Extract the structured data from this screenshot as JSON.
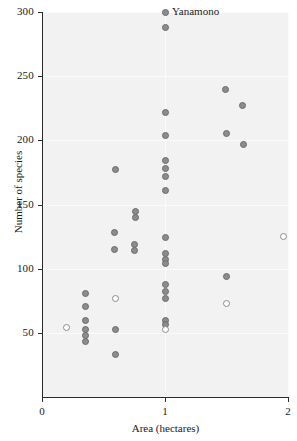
{
  "chart_data": {
    "type": "scatter",
    "title": "",
    "xlabel": "Area (hectares)",
    "ylabel": "Number of species",
    "xlim": [
      0,
      2
    ],
    "ylim": [
      0,
      300
    ],
    "xticks": [
      0,
      1,
      2
    ],
    "xtick_labels": [
      "0",
      "1",
      "2"
    ],
    "yticks": [
      50,
      100,
      150,
      200,
      250,
      300
    ],
    "ytick_labels": [
      "50",
      "100",
      "150",
      "200",
      "250",
      "300"
    ],
    "grid": true,
    "legend": "none",
    "annotations": [
      {
        "text": "Yanamono",
        "x": 1.0,
        "y": 300
      }
    ],
    "series": [
      {
        "name": "filled",
        "marker": "filled-circle",
        "color": "#8c8c8c",
        "points": [
          {
            "x": 1.0,
            "y": 300
          },
          {
            "x": 1.0,
            "y": 288
          },
          {
            "x": 1.0,
            "y": 222
          },
          {
            "x": 1.0,
            "y": 204
          },
          {
            "x": 1.0,
            "y": 184
          },
          {
            "x": 1.0,
            "y": 178
          },
          {
            "x": 1.0,
            "y": 172
          },
          {
            "x": 1.0,
            "y": 161
          },
          {
            "x": 1.0,
            "y": 124
          },
          {
            "x": 1.0,
            "y": 112
          },
          {
            "x": 1.0,
            "y": 107
          },
          {
            "x": 1.0,
            "y": 104
          },
          {
            "x": 1.0,
            "y": 88
          },
          {
            "x": 1.0,
            "y": 82
          },
          {
            "x": 1.0,
            "y": 77
          },
          {
            "x": 1.0,
            "y": 60
          },
          {
            "x": 1.0,
            "y": 57
          },
          {
            "x": 1.49,
            "y": 240
          },
          {
            "x": 1.63,
            "y": 227
          },
          {
            "x": 1.5,
            "y": 205
          },
          {
            "x": 1.64,
            "y": 197
          },
          {
            "x": 1.5,
            "y": 94
          },
          {
            "x": 0.6,
            "y": 177
          },
          {
            "x": 0.76,
            "y": 145
          },
          {
            "x": 0.76,
            "y": 140
          },
          {
            "x": 0.59,
            "y": 128
          },
          {
            "x": 0.75,
            "y": 119
          },
          {
            "x": 0.75,
            "y": 114
          },
          {
            "x": 0.59,
            "y": 115
          },
          {
            "x": 0.35,
            "y": 81
          },
          {
            "x": 0.35,
            "y": 71
          },
          {
            "x": 0.35,
            "y": 60
          },
          {
            "x": 0.35,
            "y": 53
          },
          {
            "x": 0.35,
            "y": 48
          },
          {
            "x": 0.35,
            "y": 43
          },
          {
            "x": 0.6,
            "y": 53
          },
          {
            "x": 0.6,
            "y": 33
          }
        ]
      },
      {
        "name": "open",
        "marker": "open-circle",
        "color": "#ffffff",
        "points": [
          {
            "x": 0.2,
            "y": 54
          },
          {
            "x": 0.6,
            "y": 77
          },
          {
            "x": 1.0,
            "y": 53
          },
          {
            "x": 1.5,
            "y": 73
          },
          {
            "x": 1.96,
            "y": 125
          }
        ]
      }
    ]
  }
}
